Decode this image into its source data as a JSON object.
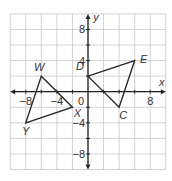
{
  "diagram": {
    "type": "coordinate-plane",
    "x_axis_label": "x",
    "y_axis_label": "y",
    "range": {
      "xmin": -10,
      "xmax": 10,
      "ymin": -10,
      "ymax": 10
    },
    "grid_step": 2,
    "tick_labels": {
      "x": [
        {
          "value": -8,
          "text": "−8"
        },
        {
          "value": -4,
          "text": "−4"
        },
        {
          "value": 8,
          "text": "8"
        }
      ],
      "y": [
        {
          "value": 8,
          "text": "8"
        },
        {
          "value": 4,
          "text": "4"
        },
        {
          "value": -4,
          "text": "−4"
        },
        {
          "value": -8,
          "text": "−8"
        }
      ],
      "origin": "0"
    },
    "triangles": [
      {
        "name": "triangle-WXY",
        "vertices": [
          {
            "label": "W",
            "x": -6,
            "y": 2
          },
          {
            "label": "X",
            "x": -2,
            "y": -2
          },
          {
            "label": "Y",
            "x": -8,
            "y": -4
          }
        ]
      },
      {
        "name": "triangle-DEC",
        "vertices": [
          {
            "label": "D",
            "x": 0,
            "y": 2
          },
          {
            "label": "E",
            "x": 6,
            "y": 4
          },
          {
            "label": "C",
            "x": 4,
            "y": -2
          }
        ]
      }
    ],
    "colors": {
      "grid": "#c8c8c8",
      "axis": "#222222",
      "shape": "#2a2a2a",
      "text": "#333333"
    }
  }
}
